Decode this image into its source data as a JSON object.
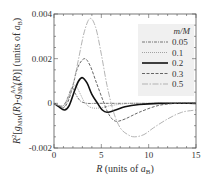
{
  "chart_data": {
    "type": "line",
    "title": "",
    "xlabel": "R  (units of a_B)",
    "ylabel": "R^2[g_MM(R) - g_MM^AA(R)] (units of a_B)",
    "xlim": [
      0,
      15
    ],
    "ylim": [
      -0.002,
      0.004
    ],
    "xticks": [
      0,
      5,
      10,
      15
    ],
    "xtick_labels": [
      "0",
      "5",
      "10",
      "15"
    ],
    "yticks": [
      -0.002,
      0,
      0.002,
      0.004
    ],
    "ytick_labels": [
      "-0.002",
      "0",
      "0.002",
      "0.004"
    ],
    "grid": false,
    "legend": {
      "title": "m/M",
      "position": "upper right",
      "entries": [
        "0.05",
        "0.1",
        "0.2",
        "0.3",
        "0.5"
      ]
    },
    "series": [
      {
        "name": "0.05",
        "style": "dash-dot",
        "color": "#666666",
        "x": [
          0,
          0.5,
          1.0,
          1.5,
          1.9,
          2.3,
          2.8,
          3.5,
          4.5,
          6,
          8,
          10,
          15
        ],
        "y": [
          0,
          -0.0001,
          -0.0001,
          0.0003,
          0.0007,
          0.0004,
          0.0001,
          0.0,
          0.0,
          0.0,
          0.0,
          0.0,
          0.0
        ]
      },
      {
        "name": "0.1",
        "style": "dotted",
        "color": "#999999",
        "x": [
          0,
          0.5,
          1.0,
          1.5,
          2.0,
          2.3,
          2.8,
          3.3,
          4.0,
          5.0,
          6.0,
          8,
          10,
          15
        ],
        "y": [
          0,
          -0.0001,
          -0.0002,
          0.0002,
          0.0007,
          0.0008,
          0.0004,
          0.0,
          -0.0002,
          -0.0002,
          -0.0001,
          0.0,
          0.0,
          0.0
        ]
      },
      {
        "name": "0.2",
        "style": "solid",
        "color": "#111111",
        "x": [
          0,
          0.5,
          1.1,
          1.6,
          2.2,
          2.6,
          3.0,
          3.5,
          4.0,
          4.6,
          5.1,
          5.6,
          6.5,
          7.5,
          9,
          11,
          15
        ],
        "y": [
          0,
          -0.00015,
          -0.0003,
          -0.0001,
          0.0006,
          0.001,
          0.00115,
          0.0009,
          0.0004,
          0.0,
          -0.0003,
          -0.0004,
          -0.0003,
          -0.00015,
          -5e-05,
          0.0,
          0.0
        ]
      },
      {
        "name": "0.3",
        "style": "dashed",
        "color": "#555555",
        "x": [
          0,
          0.5,
          1.0,
          1.5,
          2.0,
          2.5,
          3.2,
          3.8,
          4.5,
          5.2,
          5.8,
          6.5,
          7.5,
          9,
          11,
          13,
          15
        ],
        "y": [
          0,
          -0.0001,
          -0.0002,
          0.0001,
          0.0008,
          0.0016,
          0.002,
          0.0017,
          0.0009,
          0.0001,
          -0.0005,
          -0.0008,
          -0.0007,
          -0.0004,
          -0.0001,
          0.0,
          0.0
        ]
      },
      {
        "name": "0.5",
        "style": "long-dash-dot",
        "color": "#aaaaaa",
        "x": [
          0,
          0.5,
          1.0,
          1.5,
          2.0,
          2.6,
          3.2,
          3.8,
          4.4,
          5.0,
          5.6,
          6.3,
          7.0,
          7.8,
          8.5,
          9.5,
          10.5,
          12,
          13.5,
          15
        ],
        "y": [
          0,
          -0.0001,
          -0.0001,
          0.0002,
          0.0008,
          0.002,
          0.0032,
          0.0038,
          0.0034,
          0.0022,
          0.0008,
          -0.0004,
          -0.0011,
          -0.0014,
          -0.0015,
          -0.0014,
          -0.0011,
          -0.0007,
          -0.0004,
          -0.0003
        ]
      }
    ]
  }
}
